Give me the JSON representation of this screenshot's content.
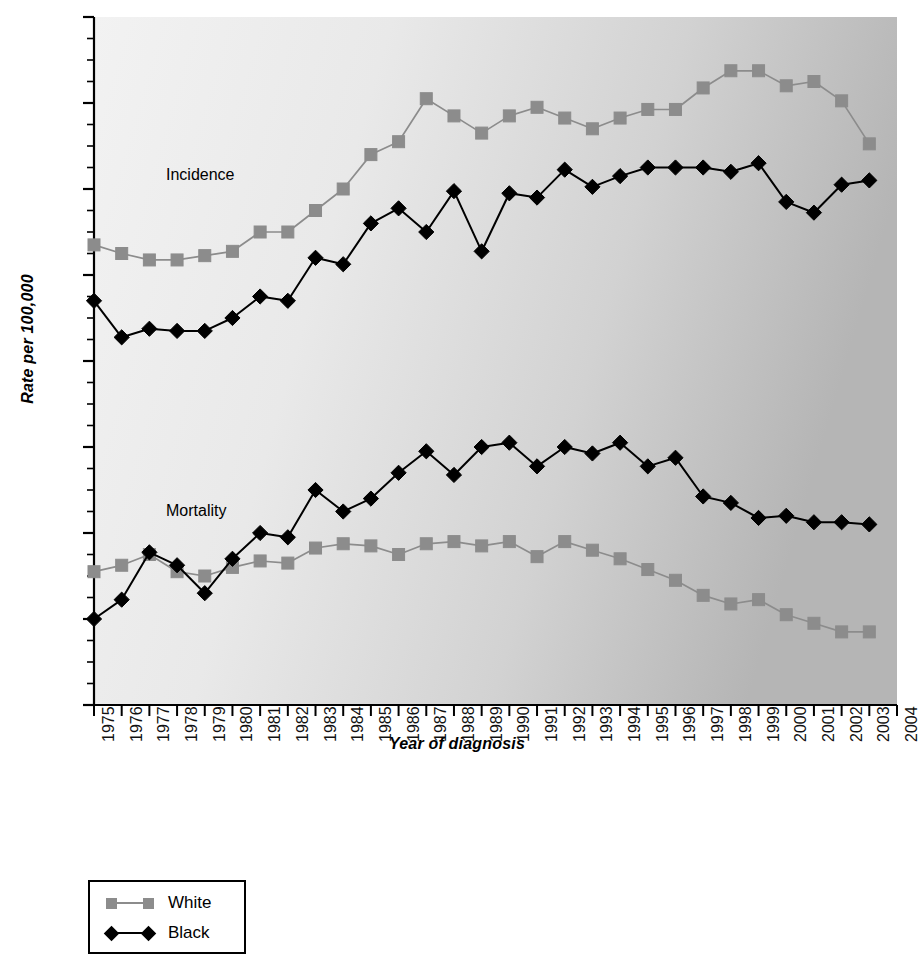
{
  "chart_data": {
    "type": "line",
    "title": "",
    "xlabel": "Year of diagnosis",
    "ylabel": "Rate per 100,000",
    "ylim": [
      0,
      160
    ],
    "ytick_values": [
      0,
      20,
      40,
      60,
      80,
      100,
      120,
      140,
      160
    ],
    "ytick_labels": [
      "0",
      "20",
      "40",
      "60",
      "80",
      "100",
      "120",
      "140",
      "160"
    ],
    "yminor_step": 5,
    "grid": false,
    "legend_position": "below-left",
    "x": [
      1975,
      1976,
      1977,
      1978,
      1979,
      1980,
      1981,
      1982,
      1983,
      1984,
      1985,
      1986,
      1987,
      1988,
      1989,
      1990,
      1991,
      1992,
      1993,
      1994,
      1995,
      1996,
      1997,
      1998,
      1999,
      2000,
      2001,
      2002,
      2003
    ],
    "xtick_labels": [
      "1975",
      "1976",
      "1977",
      "1978",
      "1979",
      "1980",
      "1981",
      "1982",
      "1983",
      "1984",
      "1985",
      "1986",
      "1987",
      "1988",
      "1989",
      "1990",
      "1991",
      "1992",
      "1993",
      "1994",
      "1995",
      "1996",
      "1997",
      "1998",
      "1999",
      "2000",
      "2001",
      "2002",
      "2003",
      "2004"
    ],
    "xlim": [
      1975,
      2004
    ],
    "annotations": [
      {
        "text": "Incidence",
        "x": 1977.6,
        "y": 123
      },
      {
        "text": "Mortality",
        "x": 1977.6,
        "y": 45
      }
    ],
    "series": [
      {
        "name": "White",
        "group": "Incidence",
        "color": "#8c8c8c",
        "marker": "square",
        "values": [
          107,
          105,
          103.5,
          103.5,
          104.5,
          105.5,
          110,
          110,
          115,
          120,
          128,
          131,
          141,
          137,
          133,
          137,
          139,
          136.5,
          134,
          136.5,
          138.5,
          138.5,
          143.5,
          147.5,
          147.5,
          144,
          145,
          140.5,
          130.5
        ]
      },
      {
        "name": "Black",
        "group": "Incidence",
        "color": "#000000",
        "marker": "diamond",
        "values": [
          94,
          85.5,
          87.5,
          87,
          87,
          90,
          95,
          94,
          104,
          102.5,
          112,
          115.5,
          110,
          119.5,
          105.5,
          119,
          118,
          124.5,
          120.5,
          123,
          125,
          125,
          125,
          124,
          126,
          117,
          114.5,
          121,
          122
        ]
      },
      {
        "name": "White",
        "group": "Mortality",
        "color": "#8c8c8c",
        "marker": "square",
        "values": [
          31,
          32.5,
          35,
          31,
          30,
          32,
          33.5,
          33,
          36.5,
          37.5,
          37,
          35,
          37.5,
          38,
          37,
          38,
          34.5,
          38,
          36,
          34,
          31.5,
          29,
          25.5,
          23.5,
          24.5,
          21,
          19,
          17,
          17
        ]
      },
      {
        "name": "Black",
        "group": "Mortality",
        "color": "#000000",
        "marker": "diamond",
        "values": [
          20,
          24.5,
          35.5,
          32.5,
          26,
          34,
          40,
          39,
          50,
          45,
          48,
          54,
          59,
          53.5,
          60,
          61,
          55.5,
          60,
          58.5,
          61,
          55.5,
          57.5,
          48.5,
          47,
          43.5,
          44,
          42.5,
          42.5,
          42
        ]
      }
    ]
  },
  "legend": {
    "items": [
      {
        "label": "White",
        "marker": "square",
        "color": "#8c8c8c"
      },
      {
        "label": "Black",
        "marker": "diamond",
        "color": "#000000"
      }
    ]
  },
  "colors": {
    "white_series": "#8c8c8c",
    "black_series": "#000000",
    "plot_bg_light": "#eeeeee",
    "plot_bg_dark": "#b4b4b4",
    "axis": "#000000"
  }
}
